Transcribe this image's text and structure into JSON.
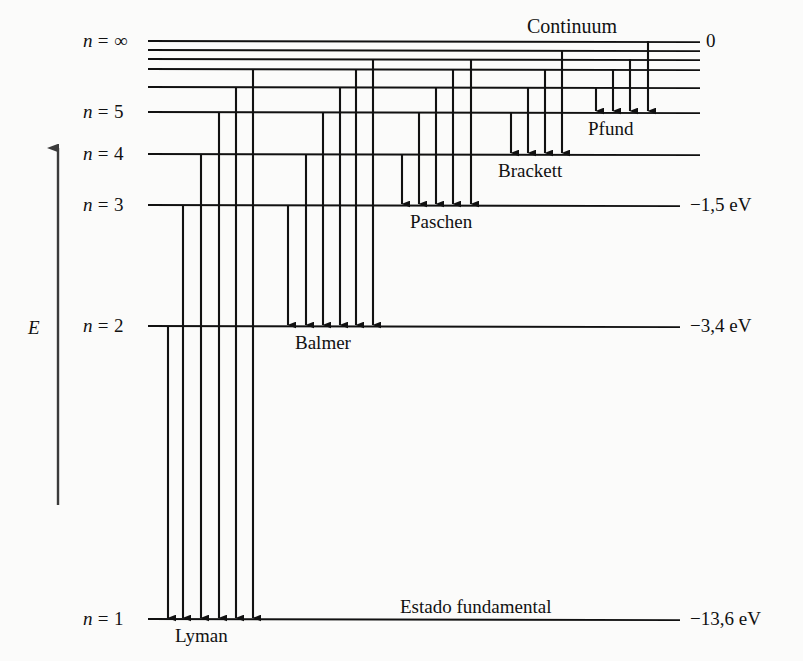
{
  "figure": {
    "title": "Continuum",
    "ground_state_label": "Estado fundamental",
    "energy_axis_label": "E",
    "level_labels": {
      "n_inf": "n = ∞",
      "n5": "n = 5",
      "n4": "n = 4",
      "n3": "n = 3",
      "n2": "n = 2",
      "n1": "n = 1"
    },
    "energy_values": {
      "e_inf": "0",
      "e3": "−1,5 eV",
      "e2": "−3,4 eV",
      "e1": "−13,6 eV"
    },
    "series_labels": {
      "lyman": "Lyman",
      "balmer": "Balmer",
      "paschen": "Paschen",
      "brackett": "Brackett",
      "pfund": "Pfund"
    },
    "colors": {
      "ink": "#111111",
      "background": "#fbfbfa"
    }
  },
  "chart_data": {
    "type": "line",
    "title": "Continuum",
    "xlabel": "",
    "ylabel": "E",
    "grid": false,
    "legend": "none",
    "levels": [
      {
        "n": "∞",
        "energy_eV": 0,
        "label": "n = ∞",
        "right_label": "0",
        "y": 41,
        "x_start": 148,
        "x_end": 700
      },
      {
        "n": "9",
        "energy_eV": -0.17,
        "label": "",
        "right_label": "",
        "y": 50,
        "x_start": 148,
        "x_end": 700
      },
      {
        "n": "8",
        "energy_eV": -0.21,
        "label": "",
        "right_label": "",
        "y": 59,
        "x_start": 148,
        "x_end": 700
      },
      {
        "n": "7",
        "energy_eV": -0.28,
        "label": "",
        "right_label": "",
        "y": 69,
        "x_start": 148,
        "x_end": 700
      },
      {
        "n": "6",
        "energy_eV": -0.38,
        "label": "",
        "right_label": "",
        "y": 87,
        "x_start": 148,
        "x_end": 700
      },
      {
        "n": "5",
        "energy_eV": -0.54,
        "label": "n = 5",
        "right_label": "",
        "y": 112,
        "x_start": 148,
        "x_end": 700
      },
      {
        "n": "4",
        "energy_eV": -0.85,
        "label": "n = 4",
        "right_label": "",
        "y": 154,
        "x_start": 148,
        "x_end": 700
      },
      {
        "n": "3",
        "energy_eV": -1.5,
        "label": "n = 3",
        "right_label": "−1,5 eV",
        "y": 205,
        "x_start": 148,
        "x_end": 680
      },
      {
        "n": "2",
        "energy_eV": -3.4,
        "label": "n = 2",
        "right_label": "−3,4 eV",
        "y": 326,
        "x_start": 148,
        "x_end": 680
      },
      {
        "n": "1",
        "energy_eV": -13.6,
        "label": "n = 1",
        "right_label": "−13,6 eV",
        "y": 619,
        "x_start": 148,
        "x_end": 680
      }
    ],
    "series": [
      {
        "name": "Lyman",
        "final_level": 1,
        "final_y": 619,
        "label_x": 175,
        "label_y": 626,
        "transitions": [
          {
            "from_n": 2,
            "top_y": 326,
            "x": 168
          },
          {
            "from_n": 3,
            "top_y": 205,
            "x": 183
          },
          {
            "from_n": 4,
            "top_y": 154,
            "x": 201
          },
          {
            "from_n": 5,
            "top_y": 112,
            "x": 219
          },
          {
            "from_n": 6,
            "top_y": 87,
            "x": 236
          },
          {
            "from_n": "∞",
            "top_y": 69,
            "x": 253
          }
        ]
      },
      {
        "name": "Balmer",
        "final_level": 2,
        "final_y": 326,
        "label_x": 295,
        "label_y": 333,
        "transitions": [
          {
            "from_n": 3,
            "top_y": 205,
            "x": 288
          },
          {
            "from_n": 4,
            "top_y": 154,
            "x": 306
          },
          {
            "from_n": 5,
            "top_y": 112,
            "x": 323
          },
          {
            "from_n": 6,
            "top_y": 87,
            "x": 340
          },
          {
            "from_n": 7,
            "top_y": 69,
            "x": 356
          },
          {
            "from_n": "∞",
            "top_y": 59,
            "x": 373
          }
        ]
      },
      {
        "name": "Paschen",
        "final_level": 3,
        "final_y": 205,
        "label_x": 410,
        "label_y": 212,
        "transitions": [
          {
            "from_n": 4,
            "top_y": 154,
            "x": 402
          },
          {
            "from_n": 5,
            "top_y": 112,
            "x": 419
          },
          {
            "from_n": 6,
            "top_y": 87,
            "x": 436
          },
          {
            "from_n": 7,
            "top_y": 69,
            "x": 453
          },
          {
            "from_n": "∞",
            "top_y": 59,
            "x": 471
          }
        ]
      },
      {
        "name": "Brackett",
        "final_level": 4,
        "final_y": 154,
        "label_x": 498,
        "label_y": 161,
        "transitions": [
          {
            "from_n": 5,
            "top_y": 112,
            "x": 511
          },
          {
            "from_n": 6,
            "top_y": 87,
            "x": 528
          },
          {
            "from_n": 7,
            "top_y": 69,
            "x": 545
          },
          {
            "from_n": "∞",
            "top_y": 50,
            "x": 562
          }
        ]
      },
      {
        "name": "Pfund",
        "final_level": 5,
        "final_y": 112,
        "label_x": 588,
        "label_y": 119,
        "transitions": [
          {
            "from_n": 6,
            "top_y": 87,
            "x": 596
          },
          {
            "from_n": 7,
            "top_y": 69,
            "x": 613
          },
          {
            "from_n": 8,
            "top_y": 59,
            "x": 630
          },
          {
            "from_n": "∞",
            "top_y": 41,
            "x": 648
          }
        ]
      }
    ],
    "energy_axis": {
      "x": 58,
      "y_top": 148,
      "y_bottom": 505,
      "direction": "up",
      "label": "E"
    }
  }
}
